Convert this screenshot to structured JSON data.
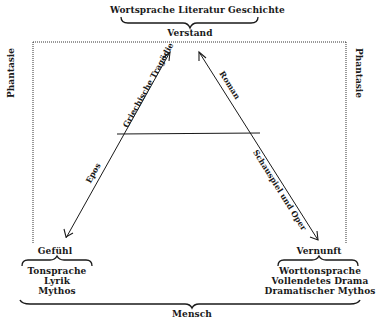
{
  "top": {
    "terms": "Wortsprache Literatur Geschichte",
    "faculty": "Verstand"
  },
  "sides": {
    "left_label": "Phantasie",
    "right_label": "Phantasie"
  },
  "edges": {
    "left_upper": "Griechische Tragödie",
    "left_lower": "Epos",
    "right_upper": "Roman",
    "right_lower": "Schauspiel und Oper"
  },
  "bottom_left": {
    "faculty": "Gefühl",
    "lines": [
      "Tonsprache",
      "Lyrik",
      "Mythos"
    ]
  },
  "bottom_right": {
    "faculty": "Vernunft",
    "lines": [
      "Worttonsprache",
      "Vollendetes Drama",
      "Dramatischer Mythos"
    ]
  },
  "base": {
    "label": "Mensch"
  },
  "colors": {
    "ink": "#1a1a1a",
    "paper": "#ffffff"
  }
}
